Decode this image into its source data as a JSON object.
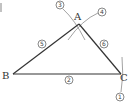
{
  "diagram": {
    "vertices": {
      "A": {
        "label": "A",
        "x": 79,
        "y": 24
      },
      "B": {
        "label": "B",
        "x": 13,
        "y": 74
      },
      "C": {
        "label": "C",
        "x": 121,
        "y": 74
      }
    },
    "step_markers": [
      {
        "label": "①",
        "x": 120,
        "y": 97
      },
      {
        "label": "②",
        "x": 69,
        "y": 79
      },
      {
        "label": "③",
        "x": 60,
        "y": 5
      },
      {
        "label": "④",
        "x": 102,
        "y": 12
      },
      {
        "label": "⑤",
        "x": 42,
        "y": 44
      },
      {
        "label": "⑥",
        "x": 104,
        "y": 44
      }
    ],
    "colors": {
      "line": "#333333",
      "construction": "#8a8a8a",
      "background": "#ffffff"
    }
  }
}
